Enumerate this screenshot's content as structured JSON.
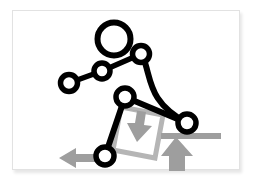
{
  "card": {
    "name": "kinematic-figure-card",
    "background_color": "#ffffff",
    "border_color": "#e2e2e2",
    "shadow": "subtle drop shadow right and bottom"
  },
  "figure": {
    "stroke_color": "#000000",
    "joint_fill_color": "#ffffff",
    "gray_color": "#9e9e9e",
    "gray_outline_color": "#b5b5b5",
    "joints": [
      {
        "name": "head",
        "cx": 101,
        "cy": 28,
        "r": 16.5,
        "stroke": 6
      },
      {
        "name": "shoulder",
        "cx": 128,
        "cy": 43,
        "r": 8.5,
        "stroke": 5.5
      },
      {
        "name": "elbow",
        "cx": 89,
        "cy": 60,
        "r": 8.0,
        "stroke": 5.5
      },
      {
        "name": "hand",
        "cx": 56,
        "cy": 72,
        "r": 8.5,
        "stroke": 5.5
      },
      {
        "name": "hip",
        "cx": 112,
        "cy": 86,
        "r": 9.0,
        "stroke": 5.5
      },
      {
        "name": "knee",
        "cx": 174,
        "cy": 112,
        "r": 9.0,
        "stroke": 5.5
      },
      {
        "name": "foot",
        "cx": 92,
        "cy": 145,
        "r": 9.0,
        "stroke": 5.5
      }
    ],
    "links": [
      {
        "name": "arm-upper",
        "path": "M 128 43 L 89 60",
        "width": 5.5
      },
      {
        "name": "arm-lower",
        "path": "M 89 60 L 56 72",
        "width": 5.5
      },
      {
        "name": "spine-curve",
        "path": "M 130 46 C 137 66 135 88 174 112",
        "width": 6
      },
      {
        "name": "thigh",
        "path": "M 112 86 L 174 112",
        "width": 6
      },
      {
        "name": "shin",
        "path": "M 112 86 L 92 145",
        "width": 6
      }
    ],
    "gray_elements": [
      {
        "name": "rotated-square-outline",
        "kind": "square",
        "points": "108,96 150,104 142,147 100,139",
        "stroke": 5
      },
      {
        "name": "down-arrow",
        "kind": "arrow",
        "direction": "down"
      },
      {
        "name": "left-arrow",
        "kind": "arrow",
        "direction": "left"
      },
      {
        "name": "ground-bar",
        "kind": "bar",
        "orientation": "horizontal"
      },
      {
        "name": "up-arrow",
        "kind": "arrow",
        "direction": "up"
      }
    ]
  }
}
